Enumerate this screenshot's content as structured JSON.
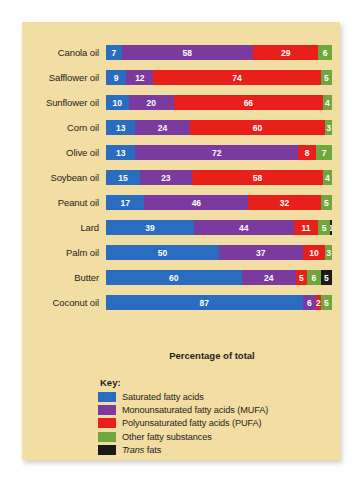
{
  "chart_data": {
    "type": "bar",
    "subtype": "stacked-horizontal-100",
    "title": "",
    "xlabel": "Percentage of total",
    "ylabel": "",
    "xlim": [
      0,
      100
    ],
    "grid": false,
    "legend_position": "bottom-left",
    "legend_title": "Key:",
    "categories": [
      "Canola oil",
      "Safflower oil",
      "Sunflower oil",
      "Corn oil",
      "Olive oil",
      "Soybean oil",
      "Peanut oil",
      "Lard",
      "Palm oil",
      "Butter",
      "Coconut oil"
    ],
    "series": [
      {
        "name": "Saturated fatty acids",
        "key": "sat",
        "color": "#2a6cc0",
        "values": [
          7,
          9,
          10,
          13,
          13,
          15,
          17,
          39,
          50,
          60,
          87
        ]
      },
      {
        "name": "Monounsaturated fatty acids (MUFA)",
        "key": "mufa",
        "color": "#7a3a9e",
        "values": [
          58,
          12,
          20,
          24,
          72,
          23,
          46,
          44,
          37,
          24,
          6
        ]
      },
      {
        "name": "Polyunsaturated fatty acids (PUFA)",
        "key": "pufa",
        "color": "#e8201b",
        "values": [
          29,
          74,
          66,
          60,
          8,
          58,
          32,
          11,
          10,
          5,
          2
        ]
      },
      {
        "name": "Other fatty substances",
        "key": "other",
        "color": "#70a73c",
        "values": [
          6,
          5,
          4,
          3,
          7,
          4,
          5,
          5,
          3,
          6,
          5
        ]
      },
      {
        "name": "Trans fats",
        "key": "trans",
        "color": "#1a1a18",
        "values": [
          0,
          0,
          0,
          0,
          0,
          0,
          0,
          1,
          0,
          5,
          0
        ]
      }
    ],
    "rows": [
      {
        "label": "Canola oil",
        "segments": [
          {
            "key": "sat",
            "value": 7,
            "label": "7"
          },
          {
            "key": "mufa",
            "value": 58,
            "label": "58"
          },
          {
            "key": "pufa",
            "value": 29,
            "label": "29"
          },
          {
            "key": "other",
            "value": 6,
            "label": "6"
          }
        ]
      },
      {
        "label": "Safflower oil",
        "segments": [
          {
            "key": "sat",
            "value": 9,
            "label": "9"
          },
          {
            "key": "mufa",
            "value": 12,
            "label": "12"
          },
          {
            "key": "pufa",
            "value": 74,
            "label": "74"
          },
          {
            "key": "other",
            "value": 5,
            "label": "5"
          }
        ]
      },
      {
        "label": "Sunflower oil",
        "segments": [
          {
            "key": "sat",
            "value": 10,
            "label": "10"
          },
          {
            "key": "mufa",
            "value": 20,
            "label": "20"
          },
          {
            "key": "pufa",
            "value": 66,
            "label": "66"
          },
          {
            "key": "other",
            "value": 4,
            "label": "4"
          }
        ]
      },
      {
        "label": "Corn oil",
        "segments": [
          {
            "key": "sat",
            "value": 13,
            "label": "13"
          },
          {
            "key": "mufa",
            "value": 24,
            "label": "24"
          },
          {
            "key": "pufa",
            "value": 60,
            "label": "60"
          },
          {
            "key": "other",
            "value": 3,
            "label": "3"
          }
        ]
      },
      {
        "label": "Olive oil",
        "segments": [
          {
            "key": "sat",
            "value": 13,
            "label": "13"
          },
          {
            "key": "mufa",
            "value": 72,
            "label": "72"
          },
          {
            "key": "pufa",
            "value": 8,
            "label": "8"
          },
          {
            "key": "other",
            "value": 7,
            "label": "7"
          }
        ]
      },
      {
        "label": "Soybean oil",
        "segments": [
          {
            "key": "sat",
            "value": 15,
            "label": "15"
          },
          {
            "key": "mufa",
            "value": 23,
            "label": "23"
          },
          {
            "key": "pufa",
            "value": 58,
            "label": "58"
          },
          {
            "key": "other",
            "value": 4,
            "label": "4"
          }
        ]
      },
      {
        "label": "Peanut oil",
        "segments": [
          {
            "key": "sat",
            "value": 17,
            "label": "17"
          },
          {
            "key": "mufa",
            "value": 46,
            "label": "46"
          },
          {
            "key": "pufa",
            "value": 32,
            "label": "32"
          },
          {
            "key": "other",
            "value": 5,
            "label": "5"
          }
        ]
      },
      {
        "label": "Lard",
        "segments": [
          {
            "key": "sat",
            "value": 39,
            "label": "39"
          },
          {
            "key": "mufa",
            "value": 44,
            "label": "44"
          },
          {
            "key": "pufa",
            "value": 11,
            "label": "11"
          },
          {
            "key": "other",
            "value": 5,
            "label": "5"
          },
          {
            "key": "trans",
            "value": 1,
            "label": "1"
          }
        ]
      },
      {
        "label": "Palm oil",
        "segments": [
          {
            "key": "sat",
            "value": 50,
            "label": "50"
          },
          {
            "key": "mufa",
            "value": 37,
            "label": "37"
          },
          {
            "key": "pufa",
            "value": 10,
            "label": "10"
          },
          {
            "key": "other",
            "value": 3,
            "label": "3"
          }
        ]
      },
      {
        "label": "Butter",
        "segments": [
          {
            "key": "sat",
            "value": 60,
            "label": "60"
          },
          {
            "key": "mufa",
            "value": 24,
            "label": "24"
          },
          {
            "key": "pufa",
            "value": 5,
            "label": "5"
          },
          {
            "key": "other",
            "value": 6,
            "label": "6"
          },
          {
            "key": "trans",
            "value": 5,
            "label": "5"
          }
        ]
      },
      {
        "label": "Coconut oil",
        "segments": [
          {
            "key": "sat",
            "value": 87,
            "label": "87"
          },
          {
            "key": "mufa",
            "value": 6,
            "label": "6"
          },
          {
            "key": "pufa",
            "value": 2,
            "label": "2"
          },
          {
            "key": "other",
            "value": 5,
            "label": "5"
          }
        ]
      }
    ],
    "legend": [
      {
        "label": "Saturated fatty acids",
        "key": "sat",
        "color": "#2a6cc0",
        "italic_prefix": ""
      },
      {
        "label": "Monounsaturated fatty acids (MUFA)",
        "key": "mufa",
        "color": "#7a3a9e",
        "italic_prefix": ""
      },
      {
        "label": "Polyunsaturated fatty acids (PUFA)",
        "key": "pufa",
        "color": "#e8201b",
        "italic_prefix": ""
      },
      {
        "label": "Other fatty substances",
        "key": "other",
        "color": "#70a73c",
        "italic_prefix": ""
      },
      {
        "label": "fats",
        "key": "trans",
        "color": "#1a1a18",
        "italic_prefix": "Trans"
      }
    ]
  },
  "figure": {
    "background_color": "#f2dda2",
    "page_color": "#ffffff"
  }
}
